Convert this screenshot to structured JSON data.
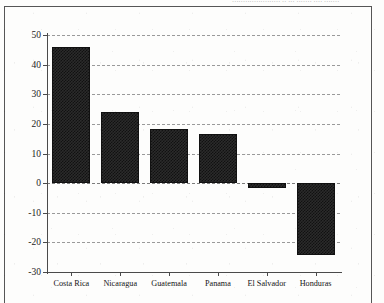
{
  "page": {
    "top_bleed_text": "······················ ·· ··· ······· ···· ·······",
    "frame_color": "#565656",
    "background_color": "#fdfdfc"
  },
  "chart_data": {
    "type": "bar",
    "title": "",
    "subtitle": "",
    "xlabel": "",
    "ylabel": "",
    "categories": [
      "Costa Rica",
      "Nicaragua",
      "Guatemala",
      "Panama",
      "El Salvador",
      "Honduras"
    ],
    "values": [
      45.8,
      23.9,
      18.2,
      16.6,
      -1.8,
      -24.4
    ],
    "series": [
      {
        "name": "",
        "values": [
          45.8,
          23.9,
          18.2,
          16.6,
          -1.8,
          -24.4
        ]
      }
    ],
    "ylim": [
      -30,
      50
    ],
    "yticks": [
      50,
      40,
      30,
      20,
      10,
      0,
      -10,
      -20,
      -30
    ],
    "ytick_labels": [
      "50",
      "40",
      "30",
      "20",
      "10",
      "0",
      "-10",
      "-20",
      "-30"
    ],
    "grid": true,
    "grid_style": "dashed-horizontal",
    "legend": null,
    "legend_position": "none",
    "bar_color": "#2b2b2b",
    "bar_pattern": "checkerboard-halftone",
    "axis_color": "#4a4a4a",
    "gridline_color": "#9a9a9a",
    "zero_line": 0,
    "annotations": []
  }
}
